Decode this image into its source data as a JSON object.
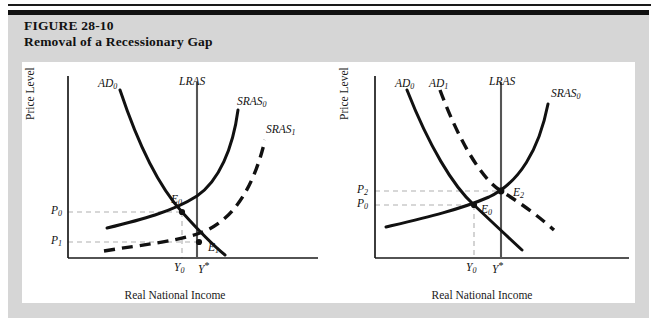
{
  "figure": {
    "number_line": "FIGURE 28-10",
    "title_line": "Removal of a Recessionary Gap"
  },
  "colors": {
    "mat": "#d6d6d6",
    "plate": "#ffffff",
    "rule": "#111111",
    "curve": "#111111",
    "lras": "#555555",
    "guide": "#b0b0b0",
    "axis": "#1a1a1a"
  },
  "panels": [
    {
      "id": "left",
      "axis": {
        "x_title": "Real National Income",
        "y_title": "Price Level"
      },
      "curve_labels": [
        {
          "name": "ad0",
          "base": "AD",
          "sub": "0",
          "sup": ""
        },
        {
          "name": "lras",
          "base": "LRAS",
          "sub": "",
          "sup": ""
        },
        {
          "name": "sras0",
          "base": "SRAS",
          "sub": "0",
          "sup": ""
        },
        {
          "name": "sras1",
          "base": "SRAS",
          "sub": "1",
          "sup": ""
        }
      ],
      "point_labels": [
        {
          "name": "e0",
          "base": "E",
          "sub": "0",
          "sup": ""
        },
        {
          "name": "e1",
          "base": "E",
          "sub": "1",
          "sup": ""
        }
      ],
      "y_ticks": [
        {
          "name": "p0",
          "base": "P",
          "sub": "0",
          "sup": ""
        },
        {
          "name": "p1",
          "base": "P",
          "sub": "1",
          "sup": ""
        }
      ],
      "x_ticks": [
        {
          "name": "y0",
          "base": "Y",
          "sub": "0",
          "sup": ""
        },
        {
          "name": "ystar",
          "base": "Y",
          "sub": "",
          "sup": "*"
        }
      ]
    },
    {
      "id": "right",
      "axis": {
        "x_title": "Real National Income",
        "y_title": "Price Level"
      },
      "curve_labels": [
        {
          "name": "ad0",
          "base": "AD",
          "sub": "0",
          "sup": ""
        },
        {
          "name": "ad1",
          "base": "AD",
          "sub": "1",
          "sup": ""
        },
        {
          "name": "lras",
          "base": "LRAS",
          "sub": "",
          "sup": ""
        },
        {
          "name": "sras0",
          "base": "SRAS",
          "sub": "0",
          "sup": ""
        }
      ],
      "point_labels": [
        {
          "name": "e0",
          "base": "E",
          "sub": "0",
          "sup": ""
        },
        {
          "name": "e2",
          "base": "E",
          "sub": "2",
          "sup": ""
        }
      ],
      "y_ticks": [
        {
          "name": "p2",
          "base": "P",
          "sub": "2",
          "sup": ""
        },
        {
          "name": "p0",
          "base": "P",
          "sub": "0",
          "sup": ""
        }
      ],
      "x_ticks": [
        {
          "name": "y0",
          "base": "Y",
          "sub": "0",
          "sup": ""
        },
        {
          "name": "ystar",
          "base": "Y",
          "sub": "",
          "sup": "*"
        }
      ]
    }
  ],
  "chart_data": {
    "type": "line",
    "title": "Removal of a Recessionary Gap",
    "subtitle": "FIGURE 28-10",
    "xlabel": "Real National Income",
    "ylabel": "Price Level",
    "axis_ticks_unnumbered": true,
    "grid": false,
    "legend": "inline curve labels",
    "panels": [
      {
        "id": "left",
        "caption": "Recessionary gap: AD0 intersects SRAS0 at E0 below potential output; SRAS shifts right to SRAS1 giving E1 at Y*",
        "series": [
          {
            "name": "AD0",
            "style": "solid",
            "shape": "downward-sloping convex"
          },
          {
            "name": "SRAS0",
            "style": "solid",
            "shape": "upward-sloping convex"
          },
          {
            "name": "SRAS1",
            "style": "dashed",
            "shape": "upward-sloping convex, shifted right/down"
          },
          {
            "name": "LRAS",
            "style": "solid-vertical",
            "shape": "vertical at Y*"
          }
        ],
        "equilibria": [
          {
            "label": "E0",
            "x_tick": "Y0",
            "y_tick": "P0",
            "curves": [
              "AD0",
              "SRAS0"
            ]
          },
          {
            "label": "E1",
            "x_tick": "Y*",
            "y_tick": "P1",
            "curves": [
              "AD0",
              "SRAS1"
            ]
          }
        ],
        "y_tick_order_top_to_bottom": [
          "P0",
          "P1"
        ],
        "x_tick_order_left_to_right": [
          "Y0",
          "Y*"
        ]
      },
      {
        "id": "right",
        "caption": "Recessionary gap removed by demand: AD shifts right from AD0 to AD1, moving equilibrium from E0 to E2 at Y*",
        "series": [
          {
            "name": "AD0",
            "style": "solid",
            "shape": "downward-sloping convex"
          },
          {
            "name": "AD1",
            "style": "dashed",
            "shape": "downward-sloping convex, shifted right"
          },
          {
            "name": "SRAS0",
            "style": "solid",
            "shape": "upward-sloping convex"
          },
          {
            "name": "LRAS",
            "style": "solid-vertical",
            "shape": "vertical at Y*"
          }
        ],
        "equilibria": [
          {
            "label": "E0",
            "x_tick": "Y0",
            "y_tick": "P0",
            "curves": [
              "AD0",
              "SRAS0"
            ]
          },
          {
            "label": "E2",
            "x_tick": "Y*",
            "y_tick": "P2",
            "curves": [
              "AD1",
              "SRAS0"
            ]
          }
        ],
        "y_tick_order_top_to_bottom": [
          "P2",
          "P0"
        ],
        "x_tick_order_left_to_right": [
          "Y0",
          "Y*"
        ]
      }
    ]
  }
}
